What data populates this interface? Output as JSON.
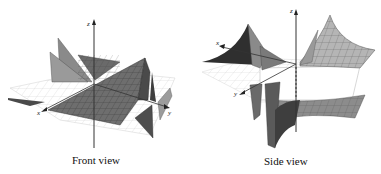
{
  "figure": {
    "panels": [
      {
        "id": "front",
        "caption": "Front view",
        "axes": {
          "x": "x",
          "y": "y",
          "z": "z"
        }
      },
      {
        "id": "side",
        "caption": "Side view",
        "axes": {
          "x": "x",
          "y": "y",
          "z": "z"
        }
      }
    ],
    "colors": {
      "surface_dark": "#5a5a5a",
      "surface_mid": "#8a8a8a",
      "surface_light": "#b8b8b8",
      "grid_plane": "#d8d8d8",
      "axis": "#333333"
    }
  }
}
